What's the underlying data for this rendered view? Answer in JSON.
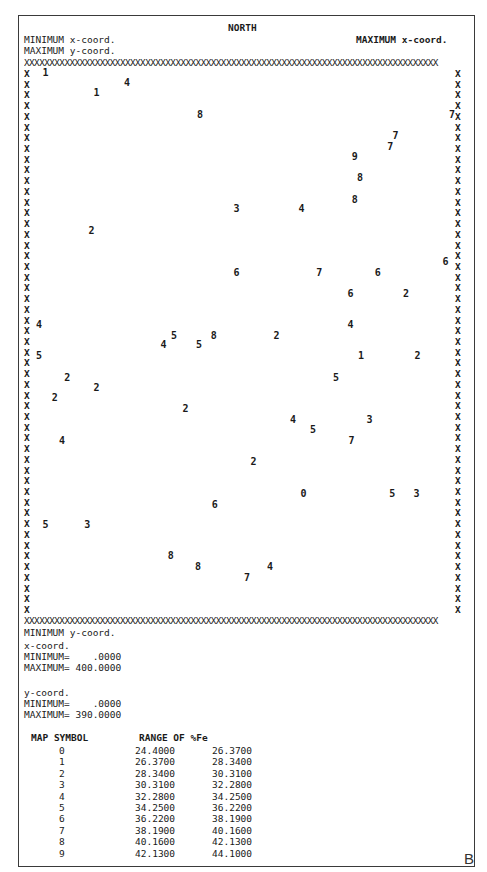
{
  "header": {
    "north": "NORTH",
    "min_x_label": "MINIMUM x-coord.",
    "max_x_label": "MAXIMUM x-coord.",
    "max_y_label": "MAXIMUM y-coord."
  },
  "border": {
    "row": "XXXXXXXXXXXXXXXXXXXXXXXXXXXXXXXXXXXXXXXXXXXXXXXXXXXXXXXXXXXXXXXXXXXXXXXXXXXXXXXXXX",
    "left_col": "X\nX\nX\nX\nX\nX\nX\nX\nX\nX\nX\nX\nX\nX\nX\nX\nX\nX\nX\nX\nX\nX\nX\nX\nX\nX\nX\nX\nX\nX\nX\nX\nX\nX\nX\nX\nX\nX\nX\nX\nX\nX\nX\nX\nX\nX\nX\nX\nX\nX\nX",
    "right_col": "X\nX\nX\nX\nX\nX\nX\nX\nX\nX\nX\nX\nX\nX\nX\nX\nX\nX\nX\nX\nX\nX\nX\nX\nX\nX\nX\nX\nX\nX\nX\nX\nX\nX\nX\nX\nX\nX\nX\nX\nX\nX\nX\nX\nX\nX\nX\nX\nX\nX\nX"
  },
  "footer": {
    "min_y_label": "MINIMUM y-coord.",
    "x_coord_title": "x-coord.",
    "x_min": "MINIMUM=    .0000",
    "x_max": "MAXIMUM= 400.0000",
    "y_coord_title": "y-coord.",
    "y_min": "MINIMUM=    .0000",
    "y_max": "MAXIMUM= 390.0000"
  },
  "legend": {
    "header_symbol": "MAP SYMBOL",
    "header_range": "RANGE OF %Fe",
    "rows": [
      {
        "symbol": "0",
        "low": "24.4000",
        "high": "26.3700"
      },
      {
        "symbol": "1",
        "low": "26.3700",
        "high": "28.3400"
      },
      {
        "symbol": "2",
        "low": "28.3400",
        "high": "30.3100"
      },
      {
        "symbol": "3",
        "low": "30.3100",
        "high": "32.2800"
      },
      {
        "symbol": "4",
        "low": "32.2800",
        "high": "34.2500"
      },
      {
        "symbol": "5",
        "low": "34.2500",
        "high": "36.2200"
      },
      {
        "symbol": "6",
        "low": "36.2200",
        "high": "38.1900"
      },
      {
        "symbol": "7",
        "low": "38.1900",
        "high": "40.1600"
      },
      {
        "symbol": "8",
        "low": "40.1600",
        "high": "42.1300"
      },
      {
        "symbol": "9",
        "low": "42.1300",
        "high": "44.1000"
      }
    ]
  },
  "panel_label": "B",
  "chart_data": {
    "type": "scatter",
    "title": "NORTH",
    "xlabel": "x-coord.",
    "ylabel": "y-coord.",
    "xlim": [
      0,
      400
    ],
    "ylim": [
      0,
      390
    ],
    "grid": false,
    "legend_position": "bottom",
    "value_name": "%Fe class symbol",
    "points": [
      {
        "x": 9,
        "y": 390,
        "symbol": "1"
      },
      {
        "x": 87,
        "y": 383,
        "symbol": "4"
      },
      {
        "x": 58,
        "y": 375,
        "symbol": "1"
      },
      {
        "x": 157,
        "y": 359,
        "symbol": "8"
      },
      {
        "x": 398,
        "y": 359,
        "symbol": "7"
      },
      {
        "x": 344,
        "y": 344,
        "symbol": "7"
      },
      {
        "x": 339,
        "y": 336,
        "symbol": "7"
      },
      {
        "x": 305,
        "y": 328,
        "symbol": "9"
      },
      {
        "x": 310,
        "y": 313,
        "symbol": "8"
      },
      {
        "x": 305,
        "y": 297,
        "symbol": "8"
      },
      {
        "x": 192,
        "y": 290,
        "symbol": "3"
      },
      {
        "x": 254,
        "y": 290,
        "symbol": "4"
      },
      {
        "x": 53,
        "y": 274,
        "symbol": "2"
      },
      {
        "x": 392,
        "y": 251,
        "symbol": "6"
      },
      {
        "x": 192,
        "y": 243,
        "symbol": "6"
      },
      {
        "x": 271,
        "y": 243,
        "symbol": "7"
      },
      {
        "x": 327,
        "y": 243,
        "symbol": "6"
      },
      {
        "x": 301,
        "y": 228,
        "symbol": "6"
      },
      {
        "x": 354,
        "y": 228,
        "symbol": "2"
      },
      {
        "x": 3,
        "y": 205,
        "symbol": "4"
      },
      {
        "x": 301,
        "y": 205,
        "symbol": "4"
      },
      {
        "x": 132,
        "y": 197,
        "symbol": "5"
      },
      {
        "x": 170,
        "y": 197,
        "symbol": "8"
      },
      {
        "x": 230,
        "y": 197,
        "symbol": "2"
      },
      {
        "x": 122,
        "y": 190,
        "symbol": "4"
      },
      {
        "x": 156,
        "y": 190,
        "symbol": "5"
      },
      {
        "x": 3,
        "y": 182,
        "symbol": "5"
      },
      {
        "x": 311,
        "y": 182,
        "symbol": "1"
      },
      {
        "x": 365,
        "y": 182,
        "symbol": "2"
      },
      {
        "x": 30,
        "y": 166,
        "symbol": "2"
      },
      {
        "x": 287,
        "y": 166,
        "symbol": "5"
      },
      {
        "x": 58,
        "y": 159,
        "symbol": "2"
      },
      {
        "x": 18,
        "y": 151,
        "symbol": "2"
      },
      {
        "x": 143,
        "y": 143,
        "symbol": "2"
      },
      {
        "x": 246,
        "y": 135,
        "symbol": "4"
      },
      {
        "x": 319,
        "y": 135,
        "symbol": "3"
      },
      {
        "x": 265,
        "y": 128,
        "symbol": "5"
      },
      {
        "x": 25,
        "y": 120,
        "symbol": "4"
      },
      {
        "x": 302,
        "y": 120,
        "symbol": "7"
      },
      {
        "x": 208,
        "y": 104,
        "symbol": "2"
      },
      {
        "x": 256,
        "y": 81,
        "symbol": "0"
      },
      {
        "x": 341,
        "y": 81,
        "symbol": "5"
      },
      {
        "x": 364,
        "y": 81,
        "symbol": "3"
      },
      {
        "x": 171,
        "y": 73,
        "symbol": "6"
      },
      {
        "x": 9,
        "y": 58,
        "symbol": "5"
      },
      {
        "x": 49,
        "y": 58,
        "symbol": "3"
      },
      {
        "x": 129,
        "y": 35,
        "symbol": "8"
      },
      {
        "x": 155,
        "y": 27,
        "symbol": "8"
      },
      {
        "x": 224,
        "y": 27,
        "symbol": "4"
      },
      {
        "x": 202,
        "y": 19,
        "symbol": "7"
      }
    ],
    "legend": [
      {
        "symbol": "0",
        "range": [
          24.4,
          26.37
        ]
      },
      {
        "symbol": "1",
        "range": [
          26.37,
          28.34
        ]
      },
      {
        "symbol": "2",
        "range": [
          28.34,
          30.31
        ]
      },
      {
        "symbol": "3",
        "range": [
          30.31,
          32.28
        ]
      },
      {
        "symbol": "4",
        "range": [
          32.28,
          34.25
        ]
      },
      {
        "symbol": "5",
        "range": [
          34.25,
          36.22
        ]
      },
      {
        "symbol": "6",
        "range": [
          36.22,
          38.19
        ]
      },
      {
        "symbol": "7",
        "range": [
          38.19,
          40.16
        ]
      },
      {
        "symbol": "8",
        "range": [
          40.16,
          42.13
        ]
      },
      {
        "symbol": "9",
        "range": [
          42.13,
          44.1
        ]
      }
    ]
  }
}
